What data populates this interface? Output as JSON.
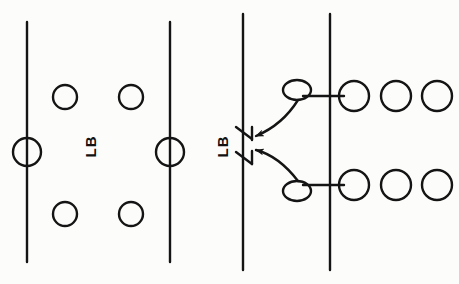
{
  "diagram": {
    "kind": "sports-play-diagram",
    "style": {
      "background_color": "#fcfcfa",
      "ink_color": "#141414",
      "line_width": 2.2,
      "circle_stroke_width": 2.4
    },
    "canvas": {
      "width": 459,
      "height": 284
    },
    "panels": [
      {
        "name": "left-panel",
        "label": "Base alignment",
        "vertical_lines": [
          {
            "name": "line-1",
            "x": 27,
            "y_top": 22,
            "y_bottom": 262
          },
          {
            "name": "line-2",
            "x": 170,
            "y_top": 22,
            "y_bottom": 262
          }
        ],
        "circles": [
          {
            "name": "circle-top-left",
            "cx": 65,
            "cy": 97,
            "r": 12
          },
          {
            "name": "circle-top-right",
            "cx": 131,
            "cy": 97,
            "r": 12
          },
          {
            "name": "circle-mid-line-1",
            "cx": 27,
            "cy": 152,
            "r": 14
          },
          {
            "name": "circle-mid-line-2",
            "cx": 170,
            "cy": 152,
            "r": 14
          },
          {
            "name": "circle-bottom-left",
            "cx": 65,
            "cy": 214,
            "r": 12
          },
          {
            "name": "circle-bottom-right",
            "cx": 131,
            "cy": 214,
            "r": 12
          }
        ],
        "text_label": "LB"
      },
      {
        "name": "right-panel",
        "label": "Blitz movement",
        "vertical_lines": [
          {
            "name": "line-3",
            "x": 243,
            "y_top": 14,
            "y_bottom": 270
          },
          {
            "name": "line-4",
            "x": 330,
            "y_top": 14,
            "y_bottom": 270
          }
        ],
        "text_label": "LB",
        "tick_markers": [
          {
            "name": "tick-upper",
            "x": 243,
            "y": 133
          },
          {
            "name": "tick-lower",
            "x": 243,
            "y": 158
          }
        ],
        "connectors": [
          {
            "name": "connector-upper",
            "x1": 303,
            "x2": 344,
            "y": 96
          },
          {
            "name": "connector-lower",
            "x1": 303,
            "x2": 344,
            "y": 185
          }
        ],
        "loops": [
          {
            "name": "loop-upper",
            "cx": 297,
            "cy": 90,
            "rx": 14,
            "ry": 10
          },
          {
            "name": "loop-lower",
            "cx": 297,
            "cy": 191,
            "rx": 14,
            "ry": 10
          }
        ],
        "arrows": [
          {
            "name": "blitz-arrow-upper",
            "from_loop": "loop-upper",
            "to_tick": "tick-upper"
          },
          {
            "name": "blitz-arrow-lower",
            "from_loop": "loop-lower",
            "to_tick": "tick-lower"
          }
        ],
        "circles_top_row": [
          {
            "name": "circle-top-row-1",
            "cx": 354,
            "cy": 96,
            "r": 15
          },
          {
            "name": "circle-top-row-2",
            "cx": 396,
            "cy": 96,
            "r": 15
          },
          {
            "name": "circle-top-row-3",
            "cx": 437,
            "cy": 96,
            "r": 15
          }
        ],
        "circles_bottom_row": [
          {
            "name": "circle-bottom-row-1",
            "cx": 354,
            "cy": 185,
            "r": 15
          },
          {
            "name": "circle-bottom-row-2",
            "cx": 396,
            "cy": 185,
            "r": 15
          },
          {
            "name": "circle-bottom-row-3",
            "cx": 437,
            "cy": 185,
            "r": 15
          }
        ]
      }
    ]
  }
}
